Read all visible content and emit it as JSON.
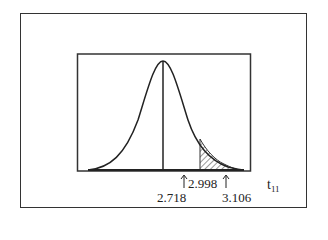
{
  "figure": {
    "distribution": "t distribution",
    "degrees_of_freedom": "11",
    "center_label": "2.718",
    "lower_marker_label": "2.998",
    "upper_marker_label": "3.106",
    "axis_label": "t",
    "axis_subscript": "11",
    "shaded_region": "right tail from 2.998"
  }
}
